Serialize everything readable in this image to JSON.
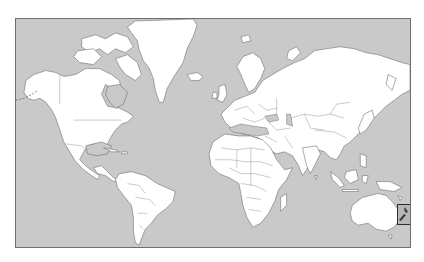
{
  "map": {
    "type": "world-political-outline",
    "projection": "mercator",
    "colors": {
      "ocean": "#c9c9c9",
      "land": "#ffffff",
      "coastline": "#707070",
      "frame": "#6e6e6e",
      "highlight_border": "#2e2e2e",
      "highlight_fill": "#b7b7b7",
      "highlight_land": "#3e3e3e"
    },
    "highlighted_region": {
      "name": "New Zealand",
      "icon": "new-zealand-highlight-box"
    }
  }
}
